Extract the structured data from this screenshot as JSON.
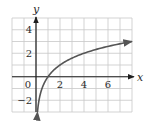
{
  "chart_data": {
    "type": "line",
    "title": "",
    "xlabel": "x",
    "ylabel": "y",
    "xlim": [
      -2,
      8
    ],
    "ylim": [
      -3,
      5
    ],
    "grid": true,
    "legend": null,
    "x_ticks": [
      {
        "value": 0,
        "label": "0"
      },
      {
        "value": 2,
        "label": "2"
      },
      {
        "value": 4,
        "label": "4"
      },
      {
        "value": 6,
        "label": "6"
      }
    ],
    "y_ticks": [
      {
        "value": 4,
        "label": "4"
      },
      {
        "value": 2,
        "label": "2"
      },
      {
        "value": -2,
        "label": "−2"
      }
    ],
    "series": [
      {
        "name": "y = log2(x)",
        "function": "log2(x)",
        "x": [
          0.125,
          0.25,
          0.5,
          1,
          2,
          3,
          4,
          5,
          6,
          7,
          8
        ],
        "values": [
          -3,
          -2,
          -1,
          0,
          1,
          1.585,
          2,
          2.322,
          2.585,
          2.807,
          3
        ],
        "arrows": "both ends",
        "color": "#555555"
      }
    ],
    "colors": {
      "grid": "#c8c8c8",
      "axis": "#1e1e1e",
      "curve": "#555555"
    }
  }
}
